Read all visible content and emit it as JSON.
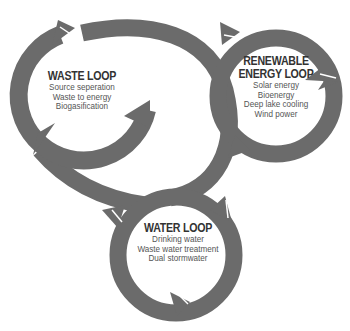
{
  "colors": {
    "arrow": "#6b6b6b",
    "background": "#ffffff",
    "title_text": "#333333",
    "item_text": "#555555"
  },
  "loops": {
    "waste": {
      "title": "WASTE LOOP",
      "items": [
        "Source seperation",
        "Waste to energy",
        "Biogasification"
      ]
    },
    "energy": {
      "title_line1": "RENEWABLE",
      "title_line2": "ENERGY LOOP",
      "items": [
        "Solar energy",
        "Bioenergy",
        "Deep lake cooling",
        "Wind power"
      ]
    },
    "water": {
      "title": "WATER LOOP",
      "items": [
        "Drinking water",
        "Waste water treatment",
        "Dual stormwater"
      ]
    }
  },
  "connectors": [
    {
      "from": "waste",
      "to": "energy",
      "shape": "curved-band"
    },
    {
      "from": "energy",
      "to": "water",
      "shape": "curved-band"
    },
    {
      "from": "waste",
      "to": "water",
      "shape": "curved-band"
    }
  ]
}
